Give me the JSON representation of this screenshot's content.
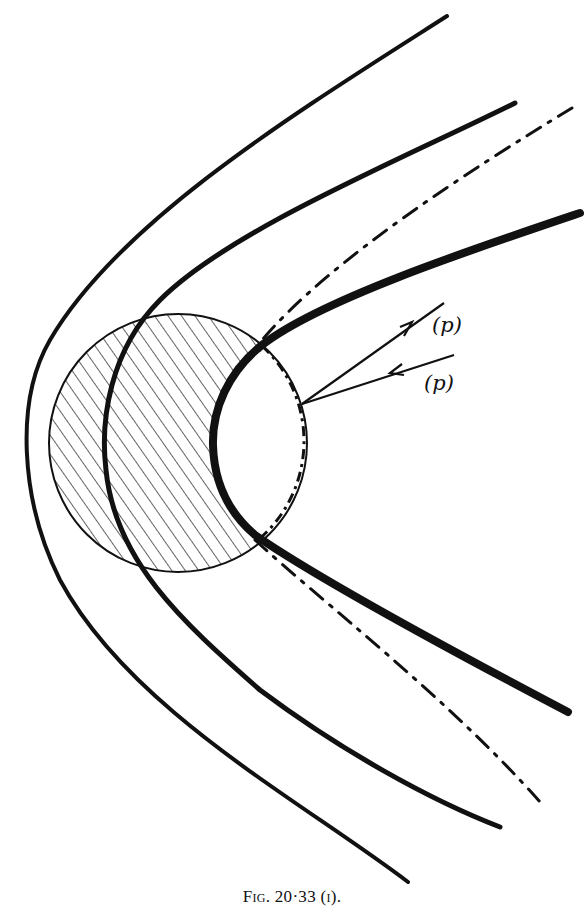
{
  "figure": {
    "caption": "Fig. 20·33 (i).",
    "labels": {
      "outgoing_ray": "(p)",
      "incoming_ray": "(p)"
    },
    "elements": {
      "hatched_sphere": {
        "cx": 178,
        "cy": 443,
        "r": 129,
        "hatch": "diagonal lines"
      },
      "curves": [
        "outer thin hyperbola",
        "middle hyperbola",
        "inner thick hyperbola (bounding)",
        "dash-dot asymptote"
      ],
      "rays": [
        "outgoing arrow",
        "incoming arrow"
      ]
    },
    "colors": {
      "ink": "#111111",
      "background": "#ffffff"
    }
  }
}
